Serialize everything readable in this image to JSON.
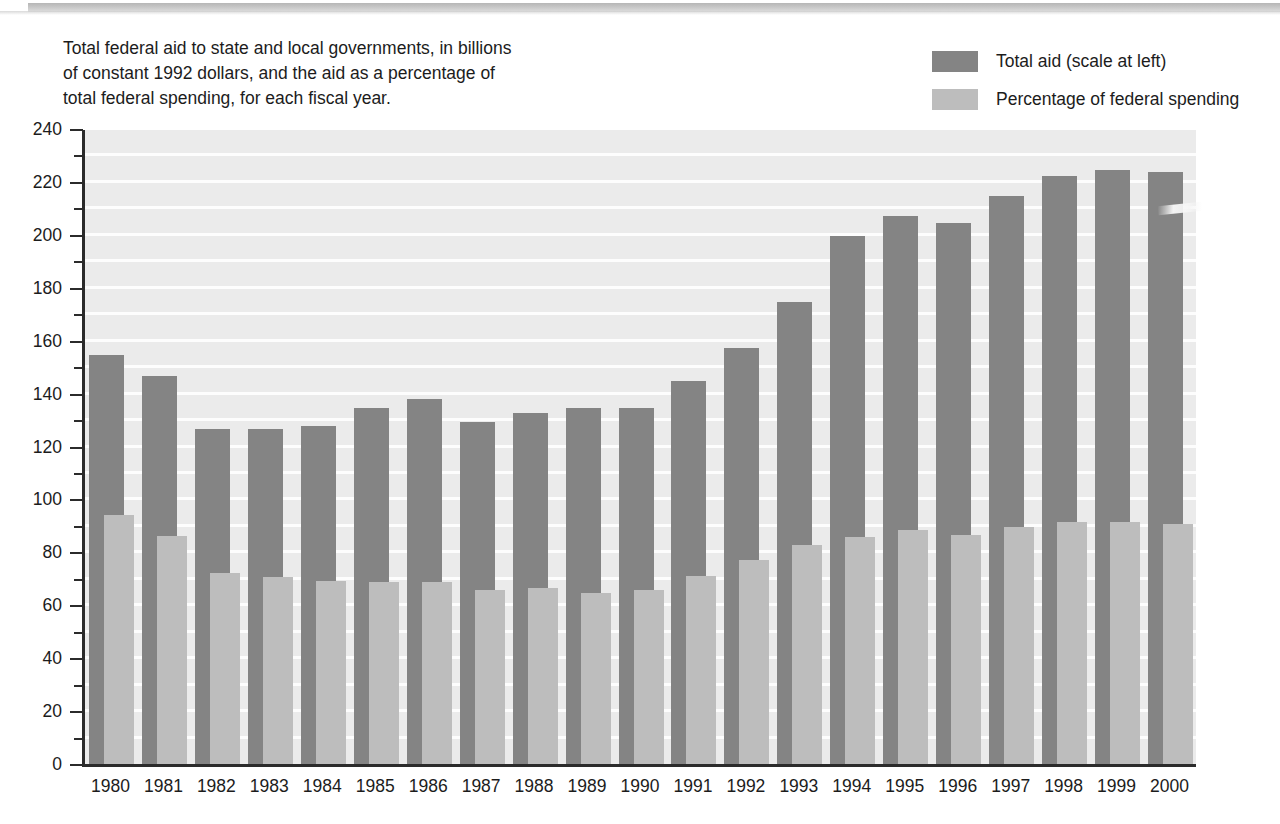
{
  "caption": "Total federal aid to state and local governments, in billions\nof constant 1992 dollars, and the aid as a percentage of\ntotal federal spending, for each fiscal year.",
  "legend": {
    "items": [
      {
        "label": "Total aid (scale at left)",
        "color": "#848484",
        "swatch_name": "legend-swatch-total-aid"
      },
      {
        "label": "Percentage of federal spending",
        "color": "#bdbdbd",
        "swatch_name": "legend-swatch-percentage"
      }
    ]
  },
  "colors": {
    "total_aid_bar": "#848484",
    "percentage_bar": "#bdbdbd",
    "plot_background": "#ebebeb",
    "gridline": "#fdfdfd",
    "axis": "#2b2b2b",
    "text": "#1c1c1c"
  },
  "chart_data": {
    "type": "bar",
    "title": "",
    "subtitle": "Total federal aid to state and local governments, in billions of constant 1992 dollars, and the aid as a percentage of total federal spending, for each fiscal year.",
    "xlabel": "",
    "ylabel": "",
    "ylim": [
      0,
      240
    ],
    "ytick_step": 20,
    "yticks": [
      0,
      20,
      40,
      60,
      80,
      100,
      120,
      140,
      160,
      180,
      200,
      220,
      240
    ],
    "minor_gridline_step": 10,
    "grid": true,
    "legend_position": "top-right",
    "categories": [
      "1980",
      "1981",
      "1982",
      "1983",
      "1984",
      "1985",
      "1986",
      "1987",
      "1988",
      "1989",
      "1990",
      "1991",
      "1992",
      "1993",
      "1994",
      "1995",
      "1996",
      "1997",
      "1998",
      "1999",
      "2000"
    ],
    "series": [
      {
        "name": "Total aid (scale at left)",
        "unit": "billions of constant 1992 dollars",
        "color": "#848484",
        "values": [
          155,
          147,
          127,
          127,
          128,
          135,
          138.5,
          129.5,
          133,
          135,
          135,
          145,
          157.5,
          175,
          200,
          207.5,
          205,
          215,
          222.5,
          225,
          224
        ]
      },
      {
        "name": "Percentage of federal spending",
        "unit": "percent",
        "color": "#bdbdbd",
        "values": [
          15.4,
          14.0,
          11.8,
          11.5,
          11.4,
          11.2,
          11.3,
          10.8,
          10.9,
          10.6,
          10.8,
          11.7,
          12.8,
          13.7,
          14.4,
          14.8,
          14.6,
          15.0,
          15.3,
          15.3,
          15.2
        ],
        "data_labels": [
          "15.4%",
          "14.0%",
          "11.8%",
          "11.5%",
          "11.4%",
          "11.2%",
          "11.3%",
          "10.8%",
          "10.9%",
          "10.6%",
          "10.8%",
          "11.7%",
          "12.8%",
          "13.7%",
          "14.4%",
          "14.8%",
          "14.6%",
          "15.0%",
          "15.3%",
          "15.3%",
          "15.2%"
        ],
        "plotted_heights_on_left_scale": [
          94.5,
          86.5,
          72.5,
          71,
          69.5,
          69,
          69,
          66,
          67,
          65,
          66,
          71.5,
          77.5,
          83,
          86,
          89,
          87,
          90,
          92,
          92,
          91
        ]
      }
    ]
  }
}
